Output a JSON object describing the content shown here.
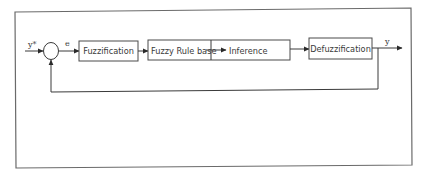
{
  "diagram": {
    "type": "fuzzy-logic-controller-block-diagram",
    "colors": {
      "stroke": "#3a3a3a",
      "frame": "#6a6a6a",
      "background": "#ffffff"
    },
    "signals": {
      "reference": "y*",
      "error": "e",
      "output": "y"
    },
    "blocks": {
      "fuzzification": "Fuzzification",
      "rule_base": "Fuzzy Rule base",
      "inference": "Inference",
      "defuzzification": "Defuzzification"
    },
    "connections": [
      {
        "from": "y*",
        "to": "summing-junction"
      },
      {
        "from": "summing-junction",
        "to": "fuzzification",
        "label": "e"
      },
      {
        "from": "fuzzification",
        "to": "rule_base"
      },
      {
        "from": "rule_base",
        "to": "inference"
      },
      {
        "from": "inference",
        "to": "defuzzification"
      },
      {
        "from": "defuzzification",
        "to": "output",
        "label": "y"
      },
      {
        "from": "output",
        "to": "summing-junction",
        "type": "feedback"
      }
    ]
  }
}
